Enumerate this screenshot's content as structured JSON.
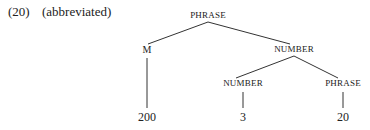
{
  "example": {
    "number": "(20)",
    "note": "(abbreviated)"
  },
  "tree": {
    "root": {
      "label": "PHRASE"
    },
    "left": {
      "label": "M",
      "leaf": "200"
    },
    "right": {
      "label": "NUMBER",
      "children": [
        {
          "label": "NUMBER",
          "leaf": "3"
        },
        {
          "label": "PHRASE",
          "leaf": "20"
        }
      ]
    }
  },
  "colors": {
    "line": "#333333",
    "text": "#222222"
  }
}
